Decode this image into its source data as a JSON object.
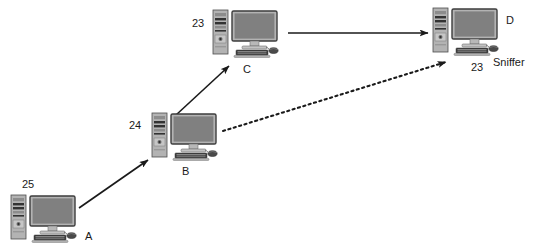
{
  "diagram": {
    "background_color": "#ffffff",
    "line_color": "#1a1a1a",
    "case_color": "#b3b3b3",
    "screen_color": "#808080",
    "width": 534,
    "height": 250
  },
  "nodes": [
    {
      "id": "A",
      "name": "computer-a",
      "id_label": "A",
      "number_label": "25",
      "note_label": "",
      "x": 10,
      "y": 194,
      "id_label_x": 85,
      "id_label_y": 231,
      "number_label_x": 22,
      "number_label_y": 179
    },
    {
      "id": "B",
      "name": "computer-b",
      "id_label": "B",
      "number_label": "24",
      "note_label": "",
      "x": 151,
      "y": 112,
      "id_label_x": 182,
      "id_label_y": 166,
      "number_label_x": 129,
      "number_label_y": 120
    },
    {
      "id": "C",
      "name": "computer-c",
      "id_label": "C",
      "number_label": "23",
      "note_label": "",
      "x": 212,
      "y": 9,
      "id_label_x": 243,
      "id_label_y": 64,
      "number_label_x": 192,
      "number_label_y": 18
    },
    {
      "id": "D",
      "name": "computer-d",
      "id_label": "D",
      "number_label": "23",
      "note_label": "Sniffer",
      "x": 432,
      "y": 7,
      "id_label_x": 506,
      "id_label_y": 15,
      "number_label_x": 471,
      "number_label_y": 62,
      "note_label_x": 493,
      "note_label_y": 57
    }
  ],
  "edges": [
    {
      "name": "edge-a-to-b",
      "from": "A",
      "to": "B",
      "style": "solid",
      "x1": 79,
      "y1": 208,
      "x2": 148,
      "y2": 160
    },
    {
      "name": "edge-b-to-c",
      "from": "B",
      "to": "C",
      "style": "solid",
      "x1": 176,
      "y1": 115,
      "x2": 229,
      "y2": 66
    },
    {
      "name": "edge-c-to-d",
      "from": "C",
      "to": "D",
      "style": "solid",
      "x1": 288,
      "y1": 33,
      "x2": 428,
      "y2": 33
    },
    {
      "name": "edge-b-to-d-sniffed",
      "from": "B",
      "to": "D",
      "style": "dotted",
      "x1": 223,
      "y1": 131,
      "x2": 446,
      "y2": 62
    }
  ]
}
